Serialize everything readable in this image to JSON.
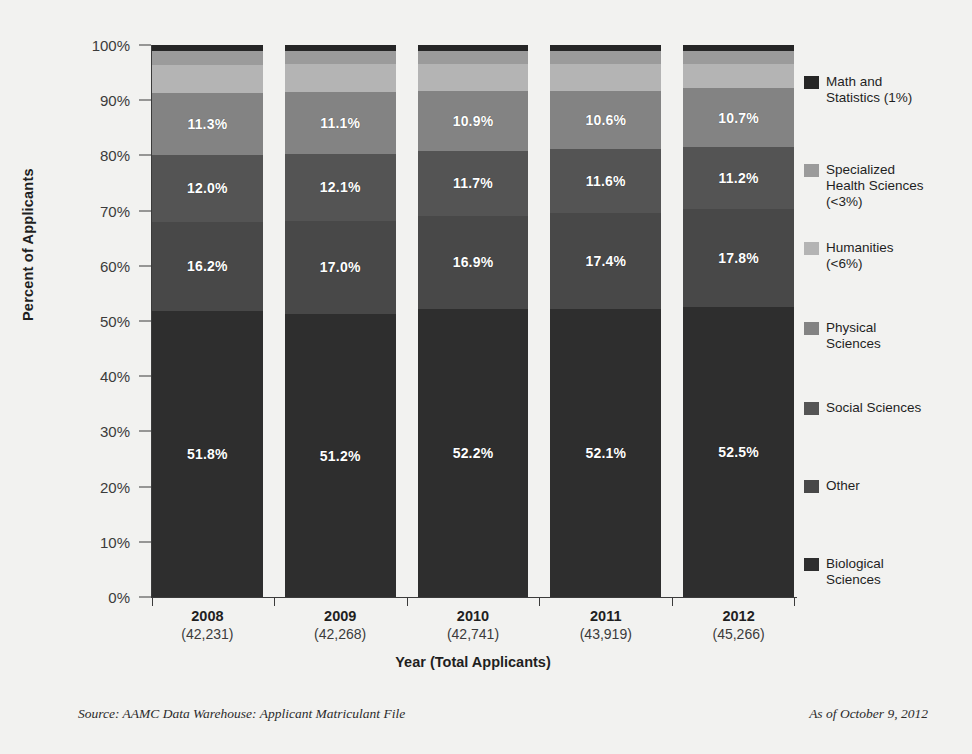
{
  "chart_data": {
    "type": "bar",
    "subtype": "stacked-100-percent",
    "title": "",
    "xlabel": "Year (Total Applicants)",
    "ylabel": "Percent of Applicants",
    "ylim": [
      0,
      100
    ],
    "ytick_labels": [
      "100%",
      "90%",
      "80%",
      "70%",
      "60%",
      "50%",
      "40%",
      "30%",
      "20%",
      "10%",
      "0%"
    ],
    "ytick_values": [
      100,
      90,
      80,
      70,
      60,
      50,
      40,
      30,
      20,
      10,
      0
    ],
    "grid": false,
    "legend_position": "right",
    "categories": [
      "2008",
      "2009",
      "2010",
      "2011",
      "2012"
    ],
    "category_totals": [
      "(42,231)",
      "(42,268)",
      "(42,741)",
      "(43,919)",
      "(45,266)"
    ],
    "series": [
      {
        "name": "Biological Sciences",
        "values": [
          51.8,
          51.2,
          52.2,
          52.1,
          52.5
        ],
        "labels": [
          "51.8%",
          "51.2%",
          "52.2%",
          "52.1%",
          "52.5%"
        ],
        "color": "#2e2e2e",
        "show_labels": true
      },
      {
        "name": "Other",
        "values": [
          16.2,
          17.0,
          16.9,
          17.4,
          17.8
        ],
        "labels": [
          "16.2%",
          "17.0%",
          "16.9%",
          "17.4%",
          "17.8%"
        ],
        "color": "#484848",
        "show_labels": true
      },
      {
        "name": "Social Sciences",
        "values": [
          12.0,
          12.1,
          11.7,
          11.6,
          11.2
        ],
        "labels": [
          "12.0%",
          "12.1%",
          "11.7%",
          "11.6%",
          "11.2%"
        ],
        "color": "#545454",
        "show_labels": true
      },
      {
        "name": "Physical Sciences",
        "values": [
          11.3,
          11.1,
          10.9,
          10.6,
          10.7
        ],
        "labels": [
          "11.3%",
          "11.1%",
          "10.9%",
          "10.6%",
          "10.7%"
        ],
        "color": "#838383",
        "show_labels": true
      },
      {
        "name": "Humanities",
        "values": [
          5.0,
          5.1,
          4.9,
          4.8,
          4.4
        ],
        "labels": [
          "",
          "",
          "",
          "",
          ""
        ],
        "color": "#b4b4b4",
        "show_labels": false
      },
      {
        "name": "Specialized Health Sciences",
        "values": [
          2.7,
          2.5,
          2.4,
          2.5,
          2.4
        ],
        "labels": [
          "",
          "",
          "",
          "",
          ""
        ],
        "color": "#9b9b9b",
        "show_labels": false
      },
      {
        "name": "Math and Statistics",
        "values": [
          1.0,
          1.0,
          1.0,
          1.0,
          1.0
        ],
        "labels": [
          "",
          "",
          "",
          "",
          ""
        ],
        "color": "#262626",
        "show_labels": false
      }
    ],
    "legend": [
      {
        "label": "Math and\nStatistics (1%)",
        "color": "#262626",
        "top": 34
      },
      {
        "label": "Specialized\nHealth Sciences\n(<3%)",
        "color": "#9b9b9b",
        "top": 122
      },
      {
        "label": "Humanities\n(<6%)",
        "color": "#b4b4b4",
        "top": 200
      },
      {
        "label": "Physical\nSciences",
        "color": "#838383",
        "top": 280
      },
      {
        "label": "Social Sciences",
        "color": "#545454",
        "top": 360
      },
      {
        "label": "Other",
        "color": "#484848",
        "top": 438
      },
      {
        "label": "Biological\nSciences",
        "color": "#2e2e2e",
        "top": 516
      }
    ]
  },
  "footer": {
    "source": "Source: AAMC Data Warehouse: Applicant Matriculant File",
    "as_of": "As of October 9, 2012"
  }
}
